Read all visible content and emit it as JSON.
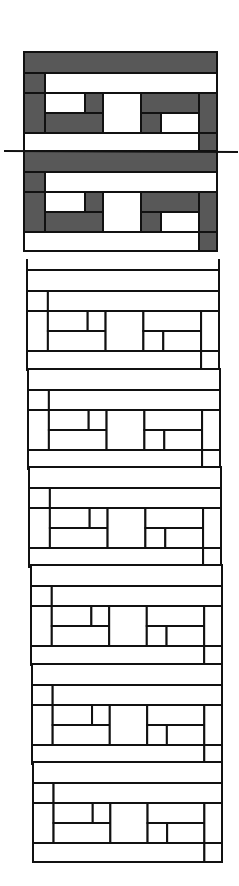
{
  "diagram": {
    "title": "",
    "colors": {
      "background": "#ffffff",
      "stroke": "#111111",
      "fill_dark": "#585858",
      "fill_light": "#ffffff"
    },
    "shaded_section": {
      "x": 24,
      "width": 193,
      "units": [
        {
          "top": 52
        },
        {
          "top": 151
        }
      ],
      "bottom": 251
    },
    "cut_line": {
      "x1": 4,
      "y1": 151,
      "x2": 238,
      "y2": 152
    },
    "outline_section": {
      "units": [
        {
          "top": 270,
          "x": 27,
          "width": 192
        },
        {
          "top": 369,
          "x": 28,
          "width": 192
        },
        {
          "top": 467,
          "x": 29,
          "width": 192
        },
        {
          "top": 565,
          "x": 31,
          "width": 191
        },
        {
          "top": 664,
          "x": 32,
          "width": 190
        },
        {
          "top": 762,
          "x": 33,
          "width": 189
        }
      ],
      "open_top": 259,
      "bottom": 840
    },
    "module": {
      "unit_height": 99,
      "rows": [
        {
          "name": "top-band",
          "y": 0,
          "h": 21
        },
        {
          "name": "second-band",
          "y": 21,
          "h": 20
        },
        {
          "name": "middle-block",
          "y": 41,
          "h": 40
        },
        {
          "name": "bottom-band",
          "y": 81,
          "h": 19
        }
      ]
    }
  }
}
